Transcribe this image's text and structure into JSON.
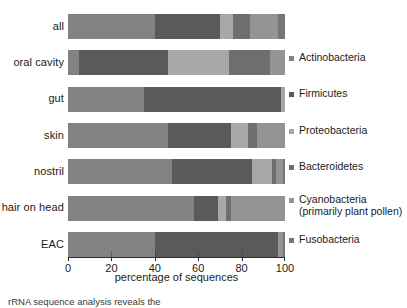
{
  "axis": {
    "xlabel": "percentage of sequences",
    "ticks": [
      {
        "value": 0,
        "label": "0"
      },
      {
        "value": 20,
        "label": "20"
      },
      {
        "value": 40,
        "label": "40"
      },
      {
        "value": 60,
        "label": "60"
      },
      {
        "value": 80,
        "label": "80"
      },
      {
        "value": 100,
        "label": "100"
      }
    ]
  },
  "legend": {
    "items": [
      {
        "label": "Actinobacteria",
        "sub": "",
        "color": "#828282"
      },
      {
        "label": "Firmicutes",
        "sub": "",
        "color": "#5a5a5a"
      },
      {
        "label": "Proteobacteria",
        "sub": "",
        "color": "#a8a8a8"
      },
      {
        "label": "Bacteroidetes",
        "sub": "",
        "color": "#6e6e6e"
      },
      {
        "label": "Cyanobacteria",
        "sub": "(primarily plant pollen)",
        "color": "#949494"
      },
      {
        "label": "Fusobacteria",
        "sub": "",
        "color": "#767676"
      }
    ]
  },
  "caption": {
    "text": "rRNA sequence analysis reveals the"
  },
  "chart_data": {
    "type": "bar",
    "orientation": "horizontal",
    "stacked": true,
    "title": "",
    "xlabel": "percentage of sequences",
    "ylabel": "",
    "xlim": [
      0,
      100
    ],
    "grid": false,
    "legend_position": "right",
    "categories": [
      "all",
      "oral cavity",
      "gut",
      "skin",
      "nostril",
      "hair on head",
      "EAC"
    ],
    "series": [
      {
        "name": "Actinobacteria",
        "color": "#828282",
        "values": [
          40,
          5,
          35,
          46,
          48,
          58,
          40
        ]
      },
      {
        "name": "Firmicutes",
        "color": "#5a5a5a",
        "values": [
          30,
          41,
          63,
          29,
          37,
          11,
          57
        ]
      },
      {
        "name": "Proteobacteria",
        "color": "#a8a8a8",
        "values": [
          6,
          28,
          2,
          8,
          9,
          4,
          0
        ]
      },
      {
        "name": "Bacteroidetes",
        "color": "#6e6e6e",
        "values": [
          8,
          19,
          0,
          4,
          2,
          2,
          0
        ]
      },
      {
        "name": "Cyanobacteria",
        "color": "#949494",
        "values": [
          13,
          7,
          0,
          13,
          3,
          25,
          2
        ]
      },
      {
        "name": "Fusobacteria",
        "color": "#767676",
        "values": [
          3,
          0,
          0,
          0,
          1,
          0,
          1
        ]
      }
    ]
  }
}
